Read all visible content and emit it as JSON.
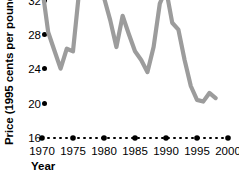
{
  "chart_data": {
    "type": "line",
    "title": "",
    "subtitle": "",
    "xlabel": "Year",
    "ylabel": "Price (1995 cents per pound)",
    "xlim": [
      1969,
      1999.5
    ],
    "ylim": [
      16,
      32
    ],
    "xticks": [
      1970,
      1975,
      1980,
      1985,
      1990,
      1995,
      2000
    ],
    "xtick_labels": [
      "1970",
      "1975",
      "1980",
      "1985",
      "1990",
      "1995",
      "2000"
    ],
    "yticks": [
      32,
      28,
      24,
      20,
      16
    ],
    "ytick_labels": [
      "32",
      "28",
      "24",
      "20",
      "16"
    ],
    "grid": false,
    "legend": "none",
    "series": [
      {
        "name": "Price (1995 cents per pound)",
        "color": "#9c9c9c",
        "x": [
          1970,
          1971,
          1972,
          1973,
          1974,
          1975,
          1976,
          1977,
          1978,
          1979,
          1980,
          1981,
          1982,
          1983,
          1984,
          1985,
          1986,
          1987,
          1988,
          1989,
          1990,
          1991,
          1992,
          1993,
          1994,
          1995,
          1996,
          1997,
          1998
        ],
        "values": [
          33.5,
          28.2,
          26.1,
          24.0,
          26.3,
          26.0,
          33.0,
          34.0,
          32.8,
          33.4,
          32.2,
          29.6,
          26.5,
          30.1,
          28.0,
          26.0,
          25.0,
          23.6,
          26.5,
          31.5,
          33.2,
          29.3,
          28.5,
          25.0,
          22.0,
          20.4,
          20.2,
          21.2,
          20.6
        ]
      }
    ]
  },
  "axis": {
    "x_axis_style": "dotted",
    "x_axis_color": "#000000",
    "y_tick_marker": "dot",
    "y_tick_marker_color": "#000000"
  }
}
